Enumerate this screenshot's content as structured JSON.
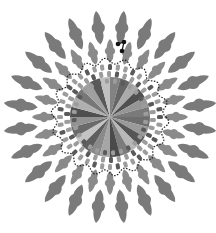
{
  "figure": {
    "center": [
      110,
      117
    ],
    "colors": {
      "background": "#ffffff",
      "petal": "#7a7a7a",
      "petal_inner": "#8a8a8a",
      "dotted_line": "#222222",
      "marker": "#111111",
      "block_dark": "#5a5a5a",
      "block_light": "#9c9c9c"
    },
    "outer_petals": {
      "count": 24,
      "radius": 90,
      "length": 34,
      "width": 14,
      "offset_deg": 7.5
    },
    "inner_petals": {
      "count": 24,
      "radius": 66,
      "length": 24,
      "width": 11,
      "offset_deg": 0
    },
    "dotted_ring": {
      "radius": 56,
      "waves": 18,
      "amplitude": 3
    },
    "block_rings": [
      {
        "radius": 50,
        "count": 40,
        "w": 6,
        "h": 4
      },
      {
        "radius": 43,
        "count": 34,
        "w": 6,
        "h": 4
      },
      {
        "radius": 36,
        "count": 28,
        "w": 5,
        "h": 4
      }
    ],
    "pie": {
      "radius": 40,
      "wedges": [
        "#6e6e6e",
        "#9a9a9a",
        "#555555",
        "#b8b8b8",
        "#7c7c7c",
        "#4a4a4a",
        "#a6a6a6",
        "#8a8a8a",
        "#5f5f5f",
        "#c4c4c4",
        "#6a6a6a",
        "#929292",
        "#4f4f4f",
        "#b0b0b0",
        "#777777",
        "#a0a0a0",
        "#585858",
        "#c0c0c0",
        "#828282",
        "#666666",
        "#aaaaaa",
        "#505050",
        "#969696",
        "#7a7a7a"
      ]
    },
    "marker": {
      "points": [
        [
          118,
          44
        ],
        [
          124,
          42
        ],
        [
          122,
          51
        ]
      ]
    }
  }
}
